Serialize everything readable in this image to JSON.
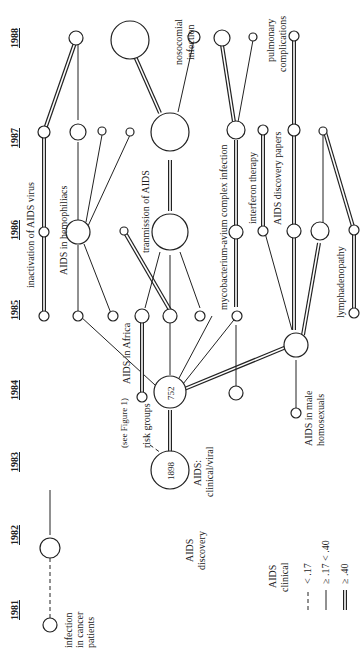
{
  "figure": {
    "orientation": "rotated-90-ccw",
    "years": [
      "1981",
      "1982",
      "1983",
      "1984",
      "1985",
      "1986",
      "1987",
      "1988"
    ],
    "nodes": {
      "infection_cancer": {
        "label_lines": [
          "infection",
          "in cancer",
          "patients"
        ]
      },
      "aids_discovery": {
        "label_lines": [
          "AIDS",
          "discovery"
        ]
      },
      "aids_clinical_viral": {
        "label_lines": [
          "AIDS:",
          "clinical/viral"
        ],
        "count": "1898"
      },
      "risk_groups": {
        "label": "risk groups",
        "count": "752"
      },
      "see_figure": {
        "label": "(see Figure 1)"
      },
      "aids_africa": {
        "label": "AIDS in Africa"
      },
      "aids_male_homosexuals": {
        "label_lines": [
          "AIDS in male",
          "homosexuals"
        ]
      },
      "inactivation": {
        "label": "inactivation of AIDS virus"
      },
      "hemophiliacs": {
        "label": "AIDS in hemophiliacs"
      },
      "transmission": {
        "label": "tranmission of AIDS"
      },
      "nosocomial": {
        "label_lines": [
          "nosocomial",
          "infection"
        ]
      },
      "mycobacterium": {
        "label": "mycobacterium-avium complex infection"
      },
      "interferon": {
        "label": "interferon therapy"
      },
      "discovery_papers": {
        "label": "AIDS discovery papers"
      },
      "pulmonary": {
        "label_lines": [
          "pulmonary",
          "complications"
        ]
      },
      "lymphadenopathy": {
        "label": "lymphadenopathy"
      }
    },
    "legend": {
      "title_lines": [
        "AIDS",
        "clinical"
      ],
      "items": [
        {
          "style": "dashed",
          "label": "< .17"
        },
        {
          "style": "single",
          "label": "≥ .17 < .40"
        },
        {
          "style": "double",
          "label": "≥ .40"
        }
      ]
    }
  }
}
